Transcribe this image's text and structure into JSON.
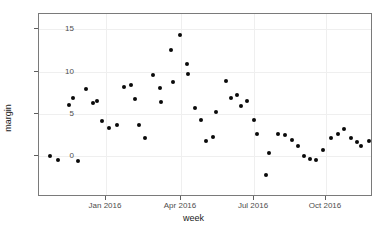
{
  "chart_data": {
    "type": "scatter",
    "title": "",
    "xlabel": "week",
    "ylabel": "margin",
    "grid": true,
    "legend": "none",
    "xlim_labels": [
      "Jan 2016",
      "Apr 2016",
      "Jul 2016",
      "Oct 2016"
    ],
    "ylim": [
      -3,
      15
    ],
    "yticks": [
      0,
      5,
      10,
      15
    ],
    "ytick_labels": [
      "0",
      "5",
      "10",
      "15"
    ],
    "xticks": [
      "Jan 2016",
      "Apr 2016",
      "Jul 2016",
      "Oct 2016"
    ],
    "marker": {
      "shape": "circle",
      "color": "#0a0a0a",
      "size": 4
    },
    "points": [
      {
        "x": 49,
        "y": 0.0
      },
      {
        "x": 57,
        "y": -0.5
      },
      {
        "x": 68,
        "y": 6.0
      },
      {
        "x": 72,
        "y": 6.9
      },
      {
        "x": 77,
        "y": -0.6
      },
      {
        "x": 85,
        "y": 7.9
      },
      {
        "x": 92,
        "y": 6.3
      },
      {
        "x": 96,
        "y": 6.45
      },
      {
        "x": 101,
        "y": 4.15
      },
      {
        "x": 108,
        "y": 3.35
      },
      {
        "x": 116,
        "y": 3.7
      },
      {
        "x": 123,
        "y": 8.15
      },
      {
        "x": 130,
        "y": 8.4
      },
      {
        "x": 134,
        "y": 6.75
      },
      {
        "x": 138,
        "y": 3.65
      },
      {
        "x": 144,
        "y": 2.1
      },
      {
        "x": 152,
        "y": 9.55
      },
      {
        "x": 159,
        "y": 8.05
      },
      {
        "x": 160,
        "y": 6.4
      },
      {
        "x": 170,
        "y": 12.5
      },
      {
        "x": 172,
        "y": 8.8
      },
      {
        "x": 179,
        "y": 14.3
      },
      {
        "x": 186,
        "y": 10.85
      },
      {
        "x": 187,
        "y": 9.65
      },
      {
        "x": 194,
        "y": 5.7
      },
      {
        "x": 200,
        "y": 4.25
      },
      {
        "x": 205,
        "y": 1.75
      },
      {
        "x": 212,
        "y": 2.3
      },
      {
        "x": 215,
        "y": 5.2
      },
      {
        "x": 225,
        "y": 8.85
      },
      {
        "x": 230,
        "y": 6.85
      },
      {
        "x": 236,
        "y": 7.2
      },
      {
        "x": 240,
        "y": 5.9
      },
      {
        "x": 246,
        "y": 6.45
      },
      {
        "x": 253,
        "y": 4.25
      },
      {
        "x": 256,
        "y": 2.6
      },
      {
        "x": 265,
        "y": -2.2
      },
      {
        "x": 268,
        "y": 0.4
      },
      {
        "x": 277,
        "y": 2.65
      },
      {
        "x": 284,
        "y": 2.5
      },
      {
        "x": 291,
        "y": 1.95
      },
      {
        "x": 297,
        "y": 1.2
      },
      {
        "x": 303,
        "y": 0.0
      },
      {
        "x": 309,
        "y": -0.35
      },
      {
        "x": 315,
        "y": -0.45
      },
      {
        "x": 322,
        "y": 0.75
      },
      {
        "x": 330,
        "y": 2.1
      },
      {
        "x": 337,
        "y": 2.6
      },
      {
        "x": 343,
        "y": 3.15
      },
      {
        "x": 350,
        "y": 2.15
      },
      {
        "x": 356,
        "y": 1.6
      },
      {
        "x": 360,
        "y": 1.15
      },
      {
        "x": 368,
        "y": 1.75
      }
    ]
  },
  "axis": {
    "x_title": "week",
    "y_title": "margin",
    "y_tick_labels": [
      "15",
      "10",
      "5",
      "0"
    ],
    "x_tick_labels": [
      "Jan 2016",
      "Apr 2016",
      "Jul 2016",
      "Oct 2016"
    ]
  },
  "colors": {
    "point": "#0a0a0a",
    "panel_border": "#7a7a7a",
    "grid": "#efefef",
    "tick_text": "#4d4d4d",
    "title_text": "#1a1a1a",
    "background": "#ffffff"
  }
}
